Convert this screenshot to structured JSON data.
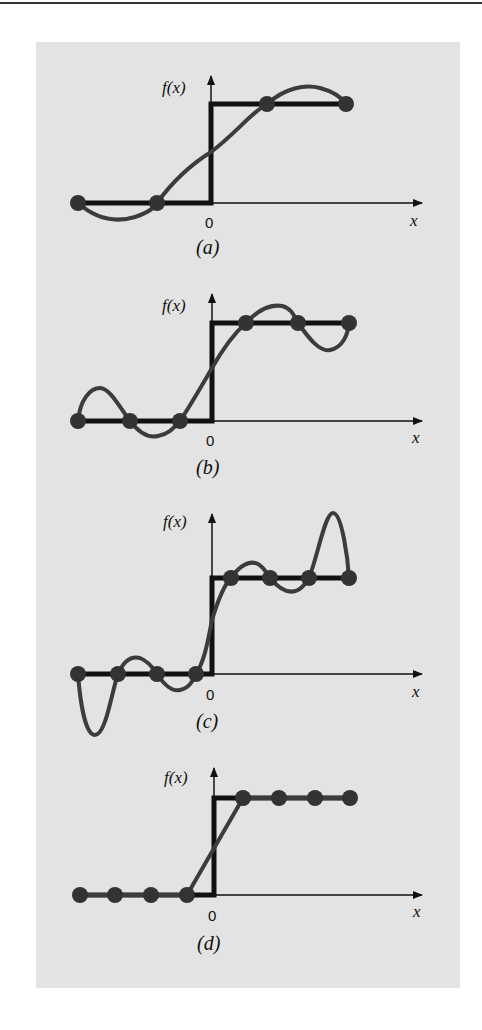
{
  "figure": {
    "panels": [
      {
        "id": "a",
        "caption": "(a)",
        "y_label": "f(x)",
        "x_label": "x",
        "origin_label": "0",
        "points": 4
      },
      {
        "id": "b",
        "caption": "(b)",
        "y_label": "f(x)",
        "x_label": "x",
        "origin_label": "0",
        "points": 6
      },
      {
        "id": "c",
        "caption": "(c)",
        "y_label": "f(x)",
        "x_label": "x",
        "origin_label": "0",
        "points": 8
      },
      {
        "id": "d",
        "caption": "(d)",
        "y_label": "f(x)",
        "x_label": "x",
        "origin_label": "0",
        "points": 8
      }
    ]
  },
  "colors": {
    "background": "#ffffff",
    "panel": "#e3e3e3",
    "step": "#111111",
    "curve": "#3c3c3c",
    "point": "#333333"
  }
}
